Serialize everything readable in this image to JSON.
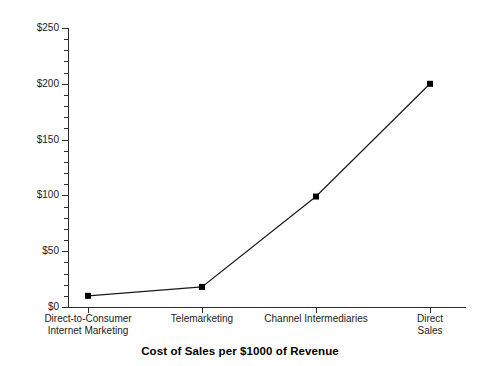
{
  "chart_data": {
    "type": "line",
    "title": "Cost of Sales per $1000 of Revenue",
    "xlabel": "",
    "ylabel": "",
    "categories": [
      "Direct-to-Consumer\nInternet Marketing",
      "Telemarketing",
      "Channel Intermediaries",
      "Direct Sales"
    ],
    "values": [
      10,
      18,
      99,
      200
    ],
    "ylim": [
      0,
      250
    ],
    "ytick_labels": [
      "$0",
      "$50",
      "$100",
      "$150",
      "$200",
      "$250"
    ],
    "ytick_values": [
      0,
      50,
      100,
      150,
      200,
      250
    ],
    "yminor_step": 10,
    "grid": false,
    "legend": false,
    "marker": "square",
    "line_color": "#1a1a1a",
    "marker_color": "#000000",
    "axis_color": "#2b2b2b"
  }
}
